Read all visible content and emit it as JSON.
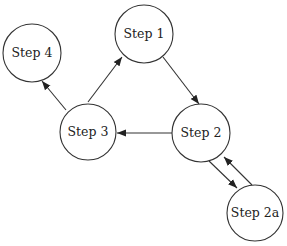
{
  "diagram": {
    "type": "flow",
    "nodes": [
      {
        "id": "step1",
        "label": "Step 1",
        "cx": 144,
        "cy": 34,
        "r": 29
      },
      {
        "id": "step2",
        "label": "Step 2",
        "cx": 201,
        "cy": 133,
        "r": 29
      },
      {
        "id": "step2a",
        "label": "Step 2a",
        "cx": 255,
        "cy": 213,
        "r": 28
      },
      {
        "id": "step3",
        "label": "Step 3",
        "cx": 88,
        "cy": 132,
        "r": 28
      },
      {
        "id": "step4",
        "label": "Step 4",
        "cx": 32,
        "cy": 53,
        "r": 29
      }
    ],
    "edges": [
      {
        "from": "step1",
        "to": "step2",
        "x1": 163,
        "y1": 57,
        "x2": 199,
        "y2": 104
      },
      {
        "from": "step2",
        "to": "step3",
        "x1": 172,
        "y1": 133,
        "x2": 117,
        "y2": 133
      },
      {
        "from": "step3",
        "to": "step1",
        "x1": 88,
        "y1": 102,
        "x2": 122,
        "y2": 57
      },
      {
        "from": "step3",
        "to": "step4",
        "x1": 66,
        "y1": 110,
        "x2": 42,
        "y2": 81
      },
      {
        "from": "step2",
        "to": "step2a",
        "x1": 209,
        "y1": 161,
        "x2": 237,
        "y2": 188
      },
      {
        "from": "step2a",
        "to": "step2",
        "x1": 252,
        "y1": 185,
        "x2": 224,
        "y2": 157
      }
    ]
  }
}
